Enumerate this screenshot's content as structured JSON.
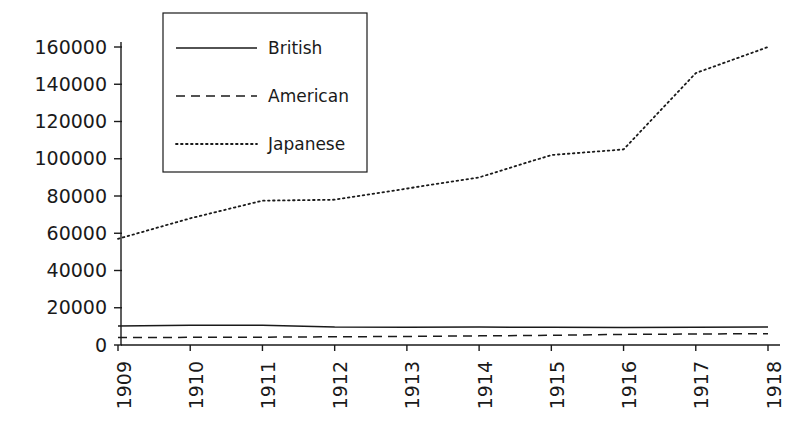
{
  "chart_data": {
    "type": "line",
    "title": "",
    "subtitle": "",
    "xlabel": "",
    "ylabel": "",
    "grid": false,
    "legend_position": "upper-left-inset",
    "x": [
      1909,
      1910,
      1911,
      1912,
      1913,
      1914,
      1915,
      1916,
      1917,
      1918
    ],
    "categories": [
      "1909",
      "1910",
      "1911",
      "1912",
      "1913",
      "1914",
      "1915",
      "1916",
      "1917",
      "1918"
    ],
    "xlim": [
      1909,
      1918
    ],
    "ylim": [
      0,
      160000
    ],
    "ytick_values": [
      0,
      20000,
      40000,
      60000,
      80000,
      100000,
      120000,
      140000,
      160000
    ],
    "ytick_labels": [
      "0",
      "20000",
      "40000",
      "60000",
      "80000",
      "100000",
      "120000",
      "140000",
      "160000"
    ],
    "xtick_labels": [
      "1909",
      "1910",
      "1911",
      "1912",
      "1913",
      "1914",
      "1915",
      "1916",
      "1917",
      "1918"
    ],
    "series": [
      {
        "name": "British",
        "style": "solid",
        "color": "#1a1a1a",
        "values": [
          10200,
          10600,
          10600,
          9600,
          9500,
          9600,
          9500,
          9400,
          9500,
          9700
        ]
      },
      {
        "name": "American",
        "style": "dashed",
        "color": "#1a1a1a",
        "values": [
          4000,
          4100,
          4200,
          4400,
          4600,
          4900,
          5200,
          5700,
          5900,
          6100
        ]
      },
      {
        "name": "Japanese",
        "style": "dotted",
        "color": "#1a1a1a",
        "values": [
          57000,
          68000,
          77500,
          78000,
          84000,
          90000,
          102000,
          105000,
          146000,
          160000
        ]
      }
    ]
  },
  "legend": {
    "entries": [
      {
        "label": "British",
        "style": "solid"
      },
      {
        "label": "American",
        "style": "dashed"
      },
      {
        "label": "Japanese",
        "style": "dotted"
      }
    ]
  },
  "colors": {
    "ink": "#1a1a1a",
    "background": "#ffffff"
  }
}
